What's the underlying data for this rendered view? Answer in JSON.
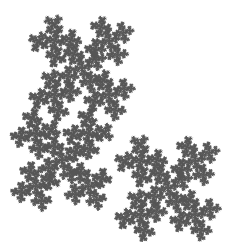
{
  "image": {
    "width": 242,
    "height": 242,
    "background": "#ffffff",
    "ink": "#555555",
    "subject": "self-similar diagonal cross fractal"
  },
  "fractal": {
    "depth": 5,
    "line_width": 0.8,
    "clusters": [
      {
        "cx": 82,
        "cy": 68,
        "size": 62,
        "angle": -45
      },
      {
        "cx": 62,
        "cy": 160,
        "size": 60,
        "angle": 45
      },
      {
        "cx": 168,
        "cy": 188,
        "size": 62,
        "angle": -45
      }
    ]
  }
}
